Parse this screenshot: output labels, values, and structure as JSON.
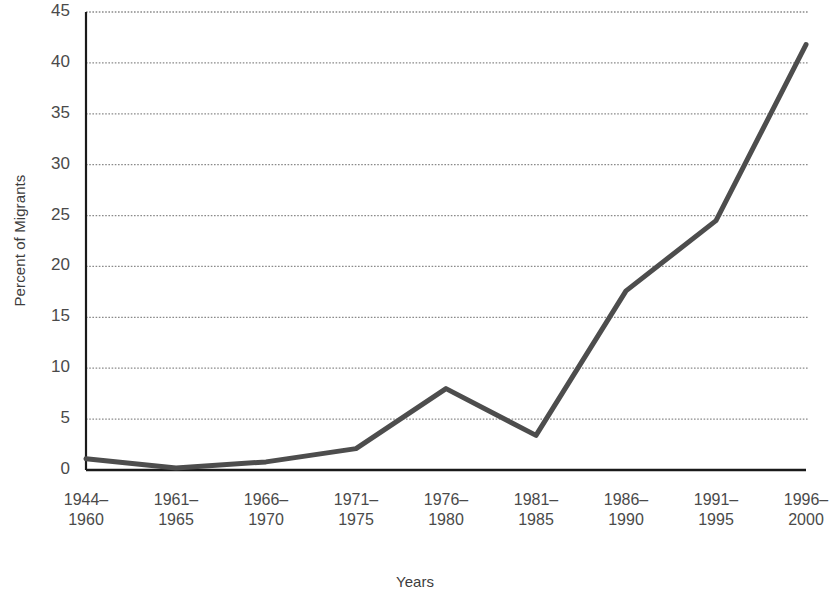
{
  "chart_data": {
    "type": "line",
    "title": "",
    "xlabel": "Years",
    "ylabel": "Percent of Migrants",
    "categories": [
      "1944–\n1960",
      "1961–\n1965",
      "1966–\n1970",
      "1971–\n1975",
      "1976–\n1980",
      "1981–\n1985",
      "1986–\n1990",
      "1991–\n1995",
      "1996–\n2000"
    ],
    "values": [
      1.1,
      0.2,
      0.8,
      2.1,
      8.0,
      3.4,
      17.6,
      24.5,
      41.8
    ],
    "ylim": [
      0,
      45
    ],
    "yticks": [
      0,
      5,
      10,
      15,
      20,
      25,
      30,
      35,
      40,
      45
    ],
    "ytick_labels": [
      "0",
      "5",
      "10",
      "15",
      "20",
      "25",
      "30",
      "35",
      "40",
      "45"
    ],
    "grid": true,
    "grid_style": "dotted",
    "grid_color": "#8a8a8a",
    "legend": "none",
    "series_color": "#4d4d4d",
    "axis_color": "#1a1a1a"
  }
}
